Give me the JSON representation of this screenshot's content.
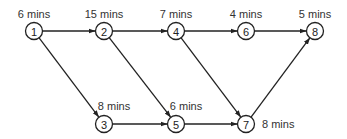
{
  "diagram": {
    "type": "network",
    "nodes": [
      {
        "id": "1",
        "label": "1",
        "x": 34,
        "y": 31,
        "duration": "6 mins",
        "lx": 34,
        "ly": 14,
        "anchor": "middle"
      },
      {
        "id": "2",
        "label": "2",
        "x": 104,
        "y": 31,
        "duration": "15 mins",
        "lx": 104,
        "ly": 14,
        "anchor": "middle"
      },
      {
        "id": "3",
        "label": "3",
        "x": 104,
        "y": 124,
        "duration": "8 mins",
        "lx": 114,
        "ly": 106,
        "anchor": "middle"
      },
      {
        "id": "4",
        "label": "4",
        "x": 176,
        "y": 31,
        "duration": "7 mins",
        "lx": 176,
        "ly": 14,
        "anchor": "middle"
      },
      {
        "id": "5",
        "label": "5",
        "x": 176,
        "y": 124,
        "duration": "6 mins",
        "lx": 186,
        "ly": 106,
        "anchor": "middle"
      },
      {
        "id": "6",
        "label": "6",
        "x": 246,
        "y": 31,
        "duration": "4 mins",
        "lx": 246,
        "ly": 14,
        "anchor": "middle"
      },
      {
        "id": "7",
        "label": "7",
        "x": 246,
        "y": 124,
        "duration": "8 mins",
        "lx": 262,
        "ly": 124,
        "anchor": "start"
      },
      {
        "id": "8",
        "label": "8",
        "x": 315,
        "y": 31,
        "duration": "5 mins",
        "lx": 315,
        "ly": 14,
        "anchor": "middle"
      }
    ],
    "edges": [
      {
        "from": "1",
        "to": "2"
      },
      {
        "from": "1",
        "to": "3"
      },
      {
        "from": "2",
        "to": "4"
      },
      {
        "from": "2",
        "to": "5"
      },
      {
        "from": "3",
        "to": "5"
      },
      {
        "from": "4",
        "to": "6"
      },
      {
        "from": "4",
        "to": "7"
      },
      {
        "from": "5",
        "to": "7"
      },
      {
        "from": "6",
        "to": "8"
      },
      {
        "from": "7",
        "to": "8"
      }
    ],
    "colors": {
      "stroke": "#222222",
      "text": "#333333",
      "background": "#ffffff"
    }
  }
}
